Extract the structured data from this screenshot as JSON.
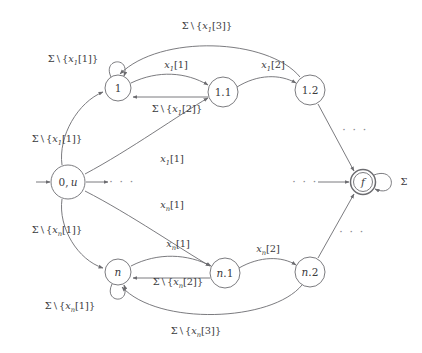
{
  "diagram": {
    "type": "finite-automaton",
    "title": "",
    "alphabet_symbol": "Σ",
    "nodes": [
      {
        "id": "start",
        "label": "0, u",
        "x": 68,
        "y": 182,
        "r": 17,
        "shape": "circle",
        "initial": true,
        "accepting": false
      },
      {
        "id": "n1",
        "label": "1",
        "x": 118,
        "y": 88,
        "r": 13,
        "shape": "circle",
        "initial": false,
        "accepting": false
      },
      {
        "id": "n1_1",
        "label": "1.1",
        "x": 223,
        "y": 92,
        "r": 15,
        "shape": "circle",
        "initial": false,
        "accepting": false
      },
      {
        "id": "n1_2",
        "label": "1.2",
        "x": 310,
        "y": 90,
        "r": 15,
        "shape": "circle",
        "initial": false,
        "accepting": false
      },
      {
        "id": "nn",
        "label": "n",
        "x": 118,
        "y": 272,
        "r": 13,
        "shape": "circle",
        "initial": false,
        "accepting": false
      },
      {
        "id": "nn_1",
        "label": "n.1",
        "x": 225,
        "y": 273,
        "r": 15,
        "shape": "circle",
        "initial": false,
        "accepting": false
      },
      {
        "id": "nn_2",
        "label": "n.2",
        "x": 310,
        "y": 272,
        "r": 15,
        "shape": "circle",
        "initial": false,
        "accepting": false
      },
      {
        "id": "final",
        "label": "f",
        "x": 363,
        "y": 182,
        "r": 12,
        "shape": "double",
        "initial": false,
        "accepting": true
      }
    ],
    "edge_labels": [
      {
        "id": "lbl-top-arc",
        "text": "Σ \\ {x₁[3]}",
        "x": 207,
        "y": 27,
        "parts": [
          "Σ",
          " \\ {",
          "x",
          "1",
          "[3]}"
        ]
      },
      {
        "id": "lbl-loop-1",
        "text": "Σ \\ {x₁[1]}",
        "x": 73,
        "y": 60,
        "parts": [
          "Σ",
          " \\ {",
          "x",
          "1",
          "[1]}"
        ]
      },
      {
        "id": "lbl-1-to-11",
        "text": "x₁[1]",
        "x": 176,
        "y": 66,
        "parts": [
          "x",
          "1",
          "[1]"
        ]
      },
      {
        "id": "lbl-11-to-12",
        "text": "x₁[2]",
        "x": 273,
        "y": 66,
        "parts": [
          "x",
          "1",
          "[2]"
        ]
      },
      {
        "id": "lbl-11-to-1",
        "text": "Σ \\ {x₁[2]}",
        "x": 177,
        "y": 110,
        "parts": [
          "Σ",
          " \\ {",
          "x",
          "1",
          "[2]}"
        ]
      },
      {
        "id": "lbl-start-to-1",
        "text": "Σ \\ {x₁[1]}",
        "x": 57,
        "y": 140,
        "parts": [
          "Σ",
          " \\ {",
          "x",
          "1",
          "[1]}"
        ]
      },
      {
        "id": "lbl-start-to-11",
        "text": "x₁[1]",
        "x": 172,
        "y": 160,
        "parts": [
          "x",
          "1",
          "[1]"
        ]
      },
      {
        "id": "lbl-start-to-n1",
        "text": "xₙ[1]",
        "x": 172,
        "y": 206,
        "parts": [
          "x",
          "n",
          "[1]"
        ]
      },
      {
        "id": "lbl-start-to-n",
        "text": "Σ \\ {xₙ[1]}",
        "x": 57,
        "y": 231,
        "parts": [
          "Σ",
          " \\ {",
          "x",
          "n",
          "[1]}"
        ]
      },
      {
        "id": "lbl-n-to-n1",
        "text": "xₙ[1]",
        "x": 178,
        "y": 245,
        "parts": [
          "x",
          "n",
          "[1]"
        ]
      },
      {
        "id": "lbl-n1-to-n2",
        "text": "xₙ[2]",
        "x": 268,
        "y": 250,
        "parts": [
          "x",
          "n",
          "[2]"
        ]
      },
      {
        "id": "lbl-n1-to-n",
        "text": "Σ \\ {xₙ[2]}",
        "x": 178,
        "y": 283,
        "parts": [
          "Σ",
          " \\ {",
          "x",
          "n",
          "[2]}"
        ]
      },
      {
        "id": "lbl-loop-n",
        "text": "Σ \\ {xₙ[1]}",
        "x": 70,
        "y": 307,
        "parts": [
          "Σ",
          " \\ {",
          "x",
          "n",
          "[1]}"
        ]
      },
      {
        "id": "lbl-bottom-arc",
        "text": "Σ \\ {xₙ[3]}",
        "x": 196,
        "y": 332,
        "parts": [
          "Σ",
          " \\ {",
          "x",
          "n",
          "[3]}"
        ]
      },
      {
        "id": "lbl-final-loop",
        "text": "Σ",
        "x": 404,
        "y": 182,
        "parts": [
          "Σ"
        ]
      }
    ],
    "ellipses": [
      {
        "id": "ellipsis-start-right",
        "text": "· · ·",
        "x": 122,
        "y": 182
      },
      {
        "id": "ellipsis-upper-right",
        "text": "· · ·",
        "x": 355,
        "y": 130
      },
      {
        "id": "ellipsis-final-left",
        "text": "· · ·",
        "x": 305,
        "y": 182
      },
      {
        "id": "ellipsis-lower-right",
        "text": "· · ·",
        "x": 352,
        "y": 232
      }
    ]
  }
}
